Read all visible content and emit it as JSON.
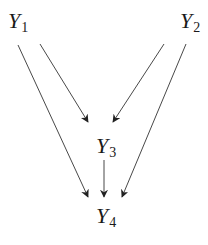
{
  "diagram": {
    "type": "directed-acyclic-graph",
    "nodes": [
      {
        "id": "Y1",
        "letter": "Y",
        "subscript": "1",
        "x": 8,
        "y": 10
      },
      {
        "id": "Y2",
        "letter": "Y",
        "subscript": "2",
        "x": 180,
        "y": 10
      },
      {
        "id": "Y3",
        "letter": "Y",
        "subscript": "3",
        "x": 96,
        "y": 135
      },
      {
        "id": "Y4",
        "letter": "Y",
        "subscript": "4",
        "x": 96,
        "y": 205
      }
    ],
    "edges": [
      {
        "from": "Y1",
        "to": "Y4",
        "x1": 18,
        "y1": 45,
        "x2": 88,
        "y2": 197
      },
      {
        "from": "Y1",
        "to": "Y3",
        "x1": 40,
        "y1": 44,
        "x2": 88,
        "y2": 122
      },
      {
        "from": "Y2",
        "to": "Y3",
        "x1": 164,
        "y1": 44,
        "x2": 113,
        "y2": 122
      },
      {
        "from": "Y2",
        "to": "Y4",
        "x1": 186,
        "y1": 44,
        "x2": 122,
        "y2": 197
      },
      {
        "from": "Y3",
        "to": "Y4",
        "x1": 104,
        "y1": 160,
        "x2": 104,
        "y2": 197
      }
    ],
    "colors": {
      "stroke": "#333333",
      "text": "#1a1a1a",
      "background": "#ffffff"
    }
  }
}
